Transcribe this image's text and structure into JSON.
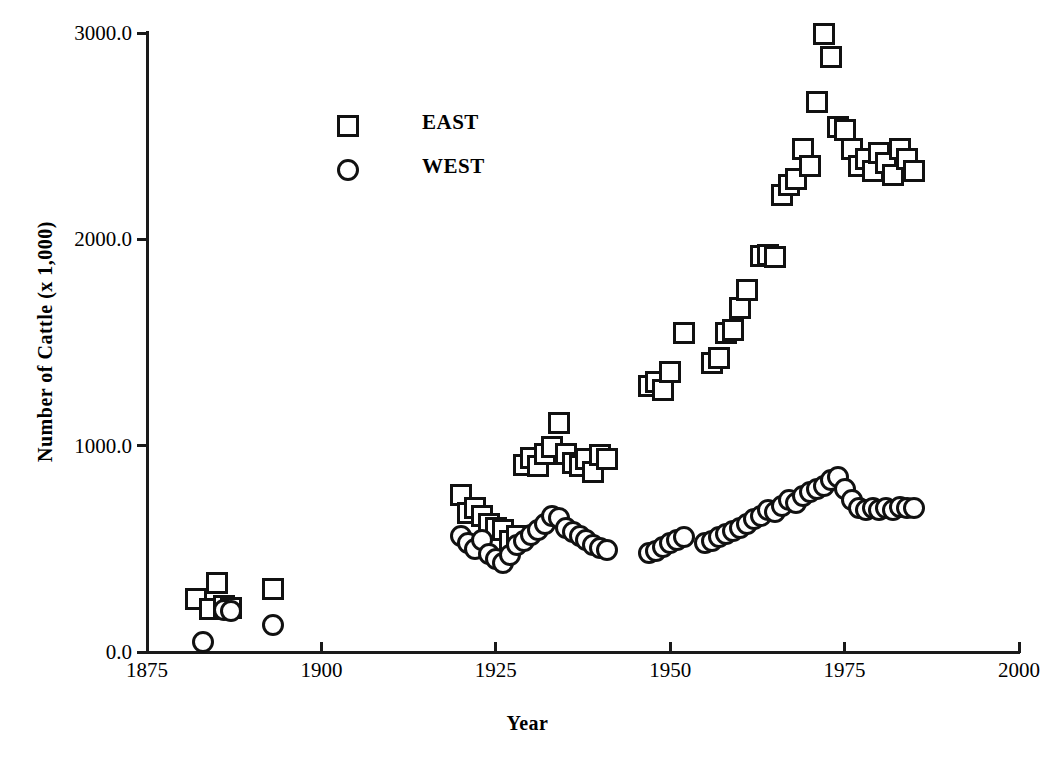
{
  "chart_data": {
    "type": "scatter",
    "title": "",
    "xlabel": "Year",
    "ylabel": "Number of Cattle (x 1,000)",
    "xlim": [
      1875,
      2000
    ],
    "ylim": [
      0,
      3000
    ],
    "xticks": [
      1875,
      1900,
      1925,
      1950,
      1975,
      2000
    ],
    "xtick_labels": [
      "1875",
      "1900",
      "1925",
      "1950",
      "1975",
      "2000"
    ],
    "yticks": [
      0,
      1000,
      2000,
      3000
    ],
    "ytick_labels": [
      "0.0",
      "1000.0",
      "2000.0",
      "3000.0"
    ],
    "grid": false,
    "legend_position": "upper-left-inside",
    "series": [
      {
        "name": "EAST",
        "marker": "square",
        "color": "#111111",
        "points": [
          [
            1882,
            255
          ],
          [
            1884,
            210
          ],
          [
            1885,
            335
          ],
          [
            1886,
            225
          ],
          [
            1887,
            215
          ],
          [
            1893,
            305
          ],
          [
            1920,
            760
          ],
          [
            1921,
            675
          ],
          [
            1922,
            700
          ],
          [
            1923,
            660
          ],
          [
            1924,
            620
          ],
          [
            1925,
            600
          ],
          [
            1926,
            590
          ],
          [
            1927,
            540
          ],
          [
            1928,
            560
          ],
          [
            1929,
            905
          ],
          [
            1930,
            940
          ],
          [
            1931,
            900
          ],
          [
            1932,
            960
          ],
          [
            1933,
            995
          ],
          [
            1934,
            1110
          ],
          [
            1935,
            960
          ],
          [
            1936,
            915
          ],
          [
            1937,
            900
          ],
          [
            1938,
            935
          ],
          [
            1939,
            870
          ],
          [
            1940,
            955
          ],
          [
            1941,
            935
          ],
          [
            1947,
            1290
          ],
          [
            1948,
            1310
          ],
          [
            1949,
            1270
          ],
          [
            1950,
            1355
          ],
          [
            1952,
            1545
          ],
          [
            1956,
            1400
          ],
          [
            1957,
            1425
          ],
          [
            1958,
            1545
          ],
          [
            1959,
            1560
          ],
          [
            1960,
            1665
          ],
          [
            1961,
            1755
          ],
          [
            1963,
            1920
          ],
          [
            1964,
            1925
          ],
          [
            1965,
            1915
          ],
          [
            1966,
            2215
          ],
          [
            1967,
            2265
          ],
          [
            1968,
            2290
          ],
          [
            1969,
            2440
          ],
          [
            1970,
            2355
          ],
          [
            1971,
            2665
          ],
          [
            1972,
            2995
          ],
          [
            1973,
            2885
          ],
          [
            1974,
            2545
          ],
          [
            1975,
            2530
          ],
          [
            1976,
            2440
          ],
          [
            1977,
            2355
          ],
          [
            1978,
            2390
          ],
          [
            1979,
            2330
          ],
          [
            1980,
            2420
          ],
          [
            1981,
            2370
          ],
          [
            1982,
            2310
          ],
          [
            1983,
            2440
          ],
          [
            1984,
            2390
          ],
          [
            1985,
            2330
          ]
        ]
      },
      {
        "name": "WEST",
        "marker": "circle",
        "color": "#111111",
        "points": [
          [
            1883,
            50
          ],
          [
            1886,
            205
          ],
          [
            1887,
            200
          ],
          [
            1893,
            130
          ],
          [
            1920,
            560
          ],
          [
            1921,
            530
          ],
          [
            1922,
            500
          ],
          [
            1923,
            545
          ],
          [
            1924,
            475
          ],
          [
            1925,
            450
          ],
          [
            1926,
            430
          ],
          [
            1927,
            470
          ],
          [
            1928,
            520
          ],
          [
            1929,
            540
          ],
          [
            1930,
            565
          ],
          [
            1931,
            590
          ],
          [
            1932,
            620
          ],
          [
            1933,
            660
          ],
          [
            1934,
            650
          ],
          [
            1935,
            600
          ],
          [
            1936,
            580
          ],
          [
            1937,
            560
          ],
          [
            1938,
            545
          ],
          [
            1939,
            520
          ],
          [
            1940,
            505
          ],
          [
            1941,
            495
          ],
          [
            1947,
            480
          ],
          [
            1948,
            490
          ],
          [
            1949,
            510
          ],
          [
            1950,
            530
          ],
          [
            1951,
            545
          ],
          [
            1952,
            555
          ],
          [
            1955,
            530
          ],
          [
            1956,
            540
          ],
          [
            1957,
            555
          ],
          [
            1958,
            570
          ],
          [
            1959,
            585
          ],
          [
            1960,
            600
          ],
          [
            1961,
            620
          ],
          [
            1962,
            645
          ],
          [
            1963,
            660
          ],
          [
            1964,
            690
          ],
          [
            1965,
            680
          ],
          [
            1966,
            710
          ],
          [
            1967,
            735
          ],
          [
            1968,
            720
          ],
          [
            1969,
            755
          ],
          [
            1970,
            775
          ],
          [
            1971,
            790
          ],
          [
            1972,
            805
          ],
          [
            1973,
            835
          ],
          [
            1974,
            850
          ],
          [
            1975,
            790
          ],
          [
            1976,
            735
          ],
          [
            1977,
            700
          ],
          [
            1978,
            690
          ],
          [
            1979,
            700
          ],
          [
            1980,
            690
          ],
          [
            1981,
            700
          ],
          [
            1982,
            690
          ],
          [
            1983,
            705
          ],
          [
            1984,
            700
          ],
          [
            1985,
            700
          ]
        ]
      }
    ],
    "legend": [
      {
        "label": "EAST",
        "marker": "square"
      },
      {
        "label": "WEST",
        "marker": "circle"
      }
    ]
  }
}
